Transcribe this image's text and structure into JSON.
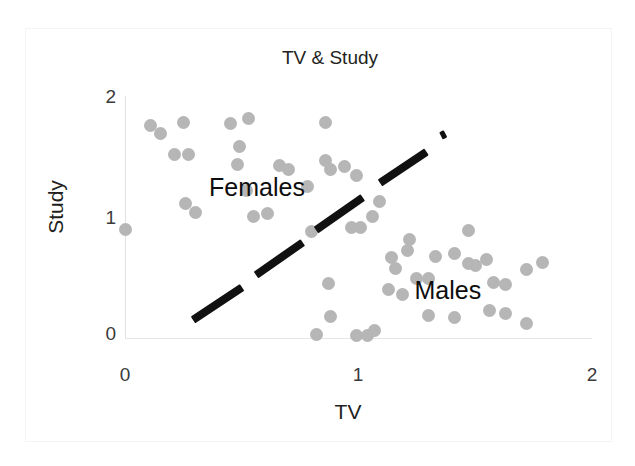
{
  "chart_data": {
    "type": "scatter",
    "title": "TV & Study",
    "xlabel": "TV",
    "ylabel": "Study",
    "xlim": [
      0,
      2
    ],
    "ylim": [
      0,
      2
    ],
    "xticks": [
      "0",
      "1",
      "2"
    ],
    "yticks": [
      "0",
      "1",
      "2"
    ],
    "xtick_values": [
      0,
      1,
      2
    ],
    "ytick_values": [
      0,
      1,
      2
    ],
    "grid": false,
    "legend": "none",
    "point_color": "#b6b6b6",
    "point_size_px": 13,
    "annotations": [
      {
        "text": "Females",
        "x": 0.36,
        "y": 1.24
      },
      {
        "text": "Males",
        "x": 1.24,
        "y": 0.38
      }
    ],
    "divider_line": {
      "style": "dashed",
      "color": "#111111",
      "x_start": 0.29,
      "y_start": 0.15,
      "x_end": 1.36,
      "y_end": 1.69,
      "segments": [
        {
          "x1": 0.29,
          "y1": 0.15,
          "x2": 0.5,
          "y2": 0.42
        },
        {
          "x1": 0.56,
          "y1": 0.52,
          "x2": 0.76,
          "y2": 0.79
        },
        {
          "x1": 0.82,
          "y1": 0.9,
          "x2": 1.02,
          "y2": 1.17
        },
        {
          "x1": 1.09,
          "y1": 1.29,
          "x2": 1.29,
          "y2": 1.55
        },
        {
          "x1": 1.355,
          "y1": 1.68,
          "x2": 1.375,
          "y2": 1.7
        }
      ]
    },
    "series": [
      {
        "name": "Females",
        "points": [
          [
            0.0,
            0.9
          ],
          [
            0.11,
            1.76
          ],
          [
            0.15,
            1.7
          ],
          [
            0.25,
            1.79
          ],
          [
            0.21,
            1.52
          ],
          [
            0.27,
            1.52
          ],
          [
            0.26,
            1.12
          ],
          [
            0.3,
            1.04
          ],
          [
            0.45,
            1.78
          ],
          [
            0.53,
            1.82
          ],
          [
            0.49,
            1.59
          ],
          [
            0.48,
            1.44
          ],
          [
            0.52,
            1.22
          ],
          [
            0.55,
            1.01
          ],
          [
            0.61,
            1.03
          ],
          [
            0.66,
            1.43
          ],
          [
            0.7,
            1.4
          ],
          [
            0.78,
            1.26
          ],
          [
            0.8,
            0.88
          ],
          [
            0.86,
            1.79
          ],
          [
            0.86,
            1.47
          ],
          [
            0.88,
            1.4
          ],
          [
            0.94,
            1.42
          ],
          [
            0.99,
            1.35
          ],
          [
            0.97,
            0.92
          ],
          [
            1.01,
            0.92
          ],
          [
            1.09,
            1.13
          ],
          [
            1.06,
            1.01
          ],
          [
            0.87,
            0.45
          ],
          [
            0.88,
            0.18
          ],
          [
            0.82,
            0.03
          ],
          [
            0.99,
            0.02
          ],
          [
            1.04,
            0.02
          ],
          [
            1.07,
            0.06
          ]
        ]
      },
      {
        "name": "Males",
        "points": [
          [
            1.22,
            0.82
          ],
          [
            1.14,
            0.67
          ],
          [
            1.21,
            0.73
          ],
          [
            1.16,
            0.58
          ],
          [
            1.25,
            0.49
          ],
          [
            1.3,
            0.49
          ],
          [
            1.33,
            0.68
          ],
          [
            1.41,
            0.7
          ],
          [
            1.47,
            0.62
          ],
          [
            1.5,
            0.6
          ],
          [
            1.13,
            0.4
          ],
          [
            1.19,
            0.36
          ],
          [
            1.47,
            0.89
          ],
          [
            1.55,
            0.65
          ],
          [
            1.58,
            0.46
          ],
          [
            1.63,
            0.44
          ],
          [
            1.72,
            0.57
          ],
          [
            1.79,
            0.63
          ],
          [
            1.63,
            0.2
          ],
          [
            1.56,
            0.23
          ],
          [
            1.41,
            0.17
          ],
          [
            1.3,
            0.19
          ],
          [
            1.72,
            0.12
          ]
        ]
      }
    ]
  }
}
